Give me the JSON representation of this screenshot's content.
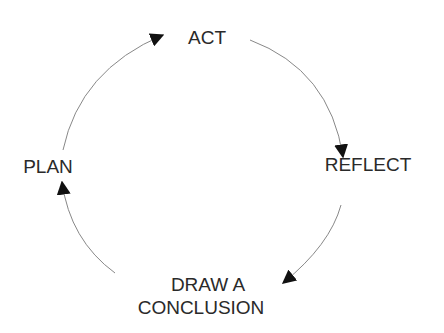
{
  "diagram": {
    "type": "cycle",
    "nodes": [
      {
        "id": "act",
        "label": "ACT"
      },
      {
        "id": "reflect",
        "label": "REFLECT"
      },
      {
        "id": "conclusion",
        "label_line1": "DRAW A",
        "label_line2": "CONCLUSION"
      },
      {
        "id": "plan",
        "label": "PLAN"
      }
    ],
    "edges": [
      {
        "from": "plan",
        "to": "act"
      },
      {
        "from": "act",
        "to": "reflect"
      },
      {
        "from": "reflect",
        "to": "conclusion"
      },
      {
        "from": "conclusion",
        "to": "plan"
      }
    ],
    "colors": {
      "text": "#2a2a2a",
      "arc": "#888888",
      "arrowhead": "#111111"
    }
  }
}
